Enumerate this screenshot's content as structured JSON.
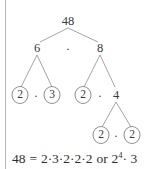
{
  "figure": {
    "type": "factor-tree",
    "ink_color": "#3a3a3a",
    "line_color": "#9a9a9a",
    "rule_color": "#b8b8b8",
    "background": "#ffffff"
  },
  "tree": {
    "root": {
      "label": "48",
      "x": 68,
      "y": 21,
      "circled": false
    },
    "level2": [
      {
        "label": "6",
        "x": 37,
        "y": 48,
        "circled": false
      },
      {
        "label": "8",
        "x": 100,
        "y": 48,
        "circled": false
      }
    ],
    "level3": [
      {
        "label": "2",
        "x": 20,
        "y": 95,
        "circled": true
      },
      {
        "label": "3",
        "x": 52,
        "y": 95,
        "circled": true
      },
      {
        "label": "2",
        "x": 83,
        "y": 95,
        "circled": true
      },
      {
        "label": "4",
        "x": 116,
        "y": 95,
        "circled": false
      }
    ],
    "level4": [
      {
        "label": "2",
        "x": 101,
        "y": 135,
        "circled": true
      },
      {
        "label": "2",
        "x": 132,
        "y": 135,
        "circled": true
      }
    ],
    "operators": [
      {
        "label": "·",
        "x": 68,
        "y": 48
      },
      {
        "label": "·",
        "x": 36,
        "y": 95
      },
      {
        "label": "·",
        "x": 100,
        "y": 95
      },
      {
        "label": "·",
        "x": 116,
        "y": 135
      }
    ],
    "edges": [
      {
        "x1": 68,
        "y1": 28,
        "x2": 40,
        "y2": 42
      },
      {
        "x1": 68,
        "y1": 28,
        "x2": 98,
        "y2": 42
      },
      {
        "x1": 37,
        "y1": 55,
        "x2": 21,
        "y2": 87
      },
      {
        "x1": 37,
        "y1": 55,
        "x2": 52,
        "y2": 87
      },
      {
        "x1": 100,
        "y1": 55,
        "x2": 84,
        "y2": 87
      },
      {
        "x1": 100,
        "y1": 55,
        "x2": 115,
        "y2": 87
      },
      {
        "x1": 116,
        "y1": 102,
        "x2": 102,
        "y2": 127
      },
      {
        "x1": 116,
        "y1": 102,
        "x2": 131,
        "y2": 127
      }
    ]
  },
  "equation": {
    "lhs": "48",
    "equals": "=",
    "expanded": "2·3·2·2·2",
    "connector": "or",
    "base": "2",
    "exponent": "4",
    "tail": "· 3",
    "full_text": "48 = 2·3·2·2·2 or 2⁴·3"
  }
}
